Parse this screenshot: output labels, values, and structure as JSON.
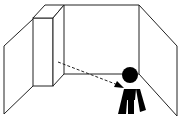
{
  "diagram": {
    "description": "Room corner with a pillar and a person; dashed arrow points from pillar toward person",
    "elements": {
      "left_wall": "left-wall",
      "pillar": "pillar",
      "back_wall": "back-wall",
      "right_wall": "right-wall",
      "arrow": "dashed-arrow",
      "person": "person-icon"
    },
    "colors": {
      "stroke": "#222222",
      "fill_person": "#000000",
      "background": "#ffffff"
    }
  }
}
